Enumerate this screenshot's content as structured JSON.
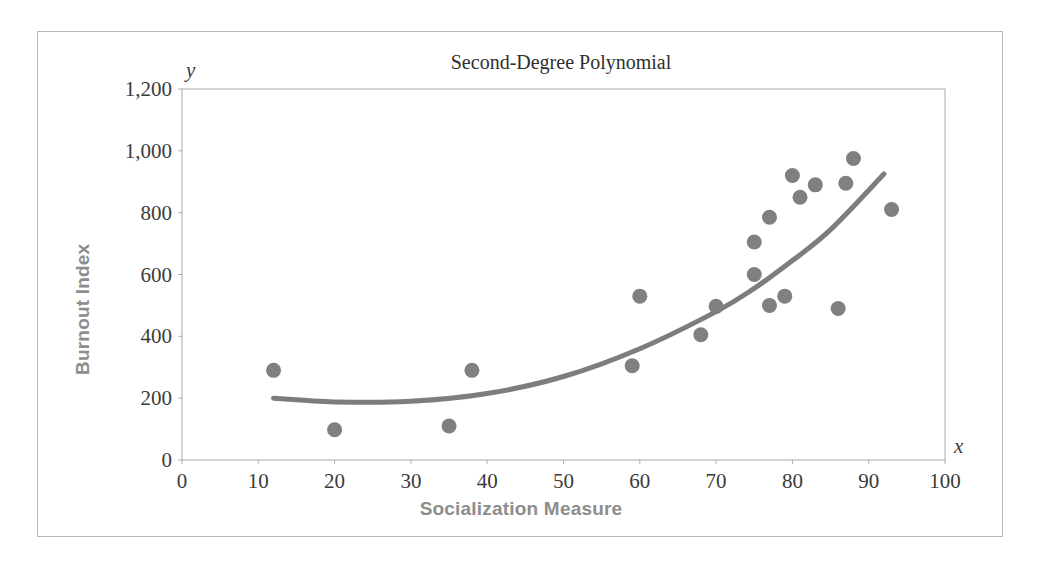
{
  "chart_data": {
    "type": "scatter",
    "title": "Second-Degree Polynomial",
    "xlabel": "Socialization Measure",
    "ylabel": "Burnout Index",
    "x_axis_letter": "x",
    "y_axis_letter": "y",
    "xlim": [
      0,
      100
    ],
    "ylim": [
      0,
      1200
    ],
    "xticks": [
      "0",
      "10",
      "20",
      "30",
      "40",
      "50",
      "60",
      "70",
      "80",
      "90",
      "100"
    ],
    "xtick_values": [
      0,
      10,
      20,
      30,
      40,
      50,
      60,
      70,
      80,
      90,
      100
    ],
    "yticks": [
      "0",
      "200",
      "400",
      "600",
      "800",
      "1,000",
      "1,200"
    ],
    "ytick_values": [
      0,
      200,
      400,
      600,
      800,
      1000,
      1200
    ],
    "grid": false,
    "legend": "none",
    "marker_color": "#808080",
    "trendline_color": "#7d7d7d",
    "axis_color": "#b0b0b0",
    "points": [
      {
        "x": 12,
        "y": 290
      },
      {
        "x": 20,
        "y": 98
      },
      {
        "x": 35,
        "y": 110
      },
      {
        "x": 38,
        "y": 290
      },
      {
        "x": 59,
        "y": 305
      },
      {
        "x": 60,
        "y": 530
      },
      {
        "x": 68,
        "y": 405
      },
      {
        "x": 70,
        "y": 497
      },
      {
        "x": 75,
        "y": 600
      },
      {
        "x": 75,
        "y": 705
      },
      {
        "x": 77,
        "y": 500
      },
      {
        "x": 77,
        "y": 785
      },
      {
        "x": 79,
        "y": 530
      },
      {
        "x": 80,
        "y": 920
      },
      {
        "x": 81,
        "y": 850
      },
      {
        "x": 83,
        "y": 890
      },
      {
        "x": 86,
        "y": 490
      },
      {
        "x": 87,
        "y": 895
      },
      {
        "x": 88,
        "y": 975
      },
      {
        "x": 93,
        "y": 810
      }
    ],
    "trendline": {
      "description": "second-degree polynomial fit",
      "x_start": 12,
      "x_end": 92,
      "points": [
        {
          "x": 12,
          "y": 200
        },
        {
          "x": 20,
          "y": 188
        },
        {
          "x": 30,
          "y": 190
        },
        {
          "x": 40,
          "y": 215
        },
        {
          "x": 50,
          "y": 270
        },
        {
          "x": 60,
          "y": 360
        },
        {
          "x": 70,
          "y": 480
        },
        {
          "x": 75,
          "y": 555
        },
        {
          "x": 80,
          "y": 645
        },
        {
          "x": 85,
          "y": 745
        },
        {
          "x": 92,
          "y": 925
        }
      ]
    }
  }
}
